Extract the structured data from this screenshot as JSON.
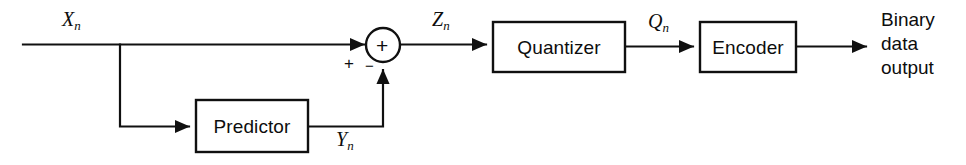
{
  "diagram": {
    "type": "block-diagram",
    "background_color": "#ffffff",
    "line_color": "#101010",
    "blocks": [
      {
        "id": "predictor",
        "label": "Predictor",
        "x": 196,
        "y": 100,
        "w": 112,
        "h": 52
      },
      {
        "id": "quantizer",
        "label": "Quantizer",
        "x": 493,
        "y": 22,
        "w": 132,
        "h": 50
      },
      {
        "id": "encoder",
        "label": "Encoder",
        "x": 700,
        "y": 22,
        "w": 96,
        "h": 50
      }
    ],
    "summing_junction": {
      "id": "summer",
      "cx": 383,
      "cy": 45,
      "r": 17,
      "inner_symbol": "+",
      "input_sign_left": "+",
      "input_sign_bottom": "−"
    },
    "signals": [
      {
        "id": "input",
        "base": "X",
        "subscript": "n",
        "x": 62,
        "y": 8
      },
      {
        "id": "error",
        "base": "Z",
        "subscript": "n",
        "x": 432,
        "y": 8
      },
      {
        "id": "prediction",
        "base": "Y",
        "subscript": "n",
        "x": 336,
        "y": 128
      },
      {
        "id": "quantized",
        "base": "Q",
        "subscript": "n",
        "x": 648,
        "y": 10
      }
    ],
    "output_label": {
      "id": "binary-data-output",
      "lines": [
        "Binary",
        "data",
        "output"
      ],
      "x": 881,
      "y": 8
    }
  }
}
